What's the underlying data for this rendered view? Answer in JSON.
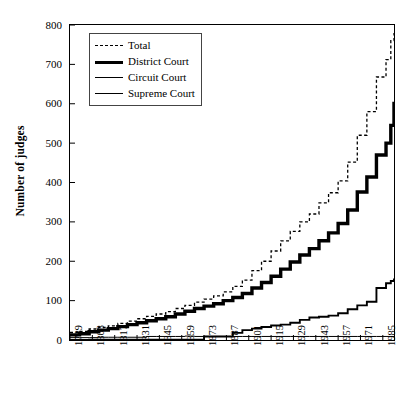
{
  "chart_data": {
    "type": "line",
    "title": "",
    "xlabel": "",
    "ylabel": "Number of judges",
    "xlim": [
      1789,
      1992
    ],
    "ylim": [
      0,
      800
    ],
    "grid": false,
    "legend_position": "top-left-inside",
    "xticks": [
      "1789",
      "1803",
      "1817",
      "1831",
      "1845",
      "1859",
      "1873",
      "1887",
      "1901",
      "1915",
      "1929",
      "1943",
      "1957",
      "1971",
      "1985"
    ],
    "yticks": [
      "0",
      "100",
      "200",
      "300",
      "400",
      "500",
      "600",
      "700",
      "800"
    ],
    "x": [
      1789,
      1795,
      1801,
      1807,
      1813,
      1819,
      1825,
      1831,
      1837,
      1843,
      1849,
      1855,
      1861,
      1867,
      1873,
      1879,
      1885,
      1891,
      1897,
      1903,
      1909,
      1915,
      1921,
      1927,
      1933,
      1939,
      1945,
      1951,
      1957,
      1963,
      1969,
      1975,
      1981,
      1987,
      1990,
      1992
    ],
    "series": [
      {
        "name": "Total",
        "style": "dashed",
        "width": 1.3,
        "values": [
          19,
          22,
          28,
          32,
          36,
          42,
          48,
          54,
          60,
          66,
          72,
          80,
          88,
          96,
          104,
          112,
          122,
          136,
          152,
          176,
          200,
          226,
          252,
          276,
          300,
          320,
          348,
          374,
          404,
          452,
          520,
          580,
          668,
          712,
          760,
          780
        ]
      },
      {
        "name": "District Court",
        "style": "solid",
        "width": 3.4,
        "values": [
          13,
          16,
          21,
          25,
          29,
          34,
          39,
          44,
          49,
          54,
          59,
          66,
          73,
          80,
          86,
          92,
          100,
          108,
          118,
          132,
          146,
          162,
          180,
          198,
          216,
          232,
          252,
          272,
          296,
          330,
          376,
          414,
          470,
          500,
          545,
          605
        ]
      },
      {
        "name": "Circuit Court",
        "style": "solid",
        "width": 1.9,
        "values": [
          0,
          0,
          1,
          1,
          1,
          1,
          1,
          1,
          1,
          1,
          1,
          1,
          1,
          1,
          9,
          9,
          9,
          18,
          25,
          29,
          33,
          37,
          39,
          44,
          51,
          57,
          59,
          62,
          68,
          78,
          88,
          97,
          132,
          144,
          150,
          156
        ]
      },
      {
        "name": "Supreme Court",
        "style": "solid",
        "width": 1.0,
        "values": [
          6,
          6,
          6,
          7,
          7,
          7,
          7,
          7,
          9,
          9,
          9,
          9,
          10,
          9,
          9,
          9,
          9,
          9,
          9,
          9,
          9,
          9,
          9,
          9,
          9,
          9,
          9,
          9,
          9,
          9,
          9,
          9,
          9,
          9,
          9,
          9
        ]
      }
    ]
  },
  "legend": {
    "items": [
      {
        "label": "Total",
        "key": "total"
      },
      {
        "label": "District Court",
        "key": "district"
      },
      {
        "label": "Circuit Court",
        "key": "circuit"
      },
      {
        "label": "Supreme Court",
        "key": "supreme"
      }
    ]
  }
}
